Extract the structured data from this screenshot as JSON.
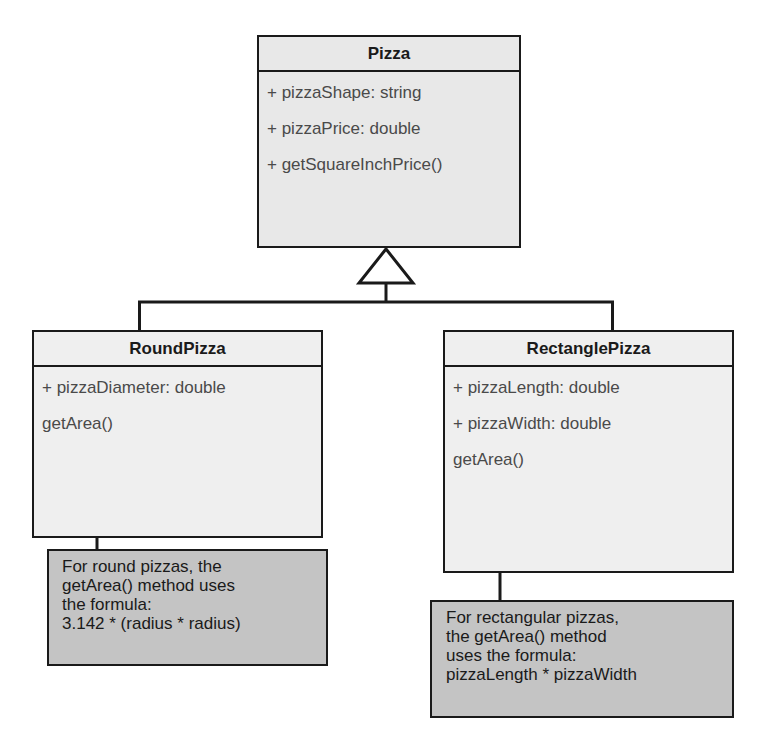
{
  "diagram": {
    "type": "uml-class-diagram",
    "relationship": "generalization",
    "colors": {
      "line": "#1a1a1a",
      "class_fill": "#e8e8e8",
      "note_fill": "#c4c4c4",
      "member_text": "#4a4a4a"
    }
  },
  "classes": {
    "pizza": {
      "name": "Pizza",
      "members": [
        "+ pizzaShape: string",
        "+ pizzaPrice: double",
        "+ getSquareInchPrice()"
      ]
    },
    "round_pizza": {
      "name": "RoundPizza",
      "members": [
        "+ pizzaDiameter: double",
        "getArea()"
      ]
    },
    "rectangle_pizza": {
      "name": "RectanglePizza",
      "members": [
        "+ pizzaLength: double",
        "+ pizzaWidth: double",
        "getArea()"
      ]
    }
  },
  "notes": {
    "round": {
      "lines": [
        "For round pizzas, the",
        "getArea() method uses",
        "the formula:",
        "3.142 * (radius * radius)"
      ]
    },
    "rectangle": {
      "lines": [
        "For rectangular pizzas,",
        "the getArea() method",
        "uses the formula:",
        "pizzaLength * pizzaWidth"
      ]
    }
  },
  "edges": [
    {
      "from": "RoundPizza",
      "to": "Pizza",
      "kind": "inheritance"
    },
    {
      "from": "RectanglePizza",
      "to": "Pizza",
      "kind": "inheritance"
    },
    {
      "from": "round-note",
      "to": "RoundPizza.getArea()",
      "kind": "annotation-arrow"
    },
    {
      "from": "rectangle-note",
      "to": "RectanglePizza.getArea()",
      "kind": "annotation-arrow"
    }
  ]
}
